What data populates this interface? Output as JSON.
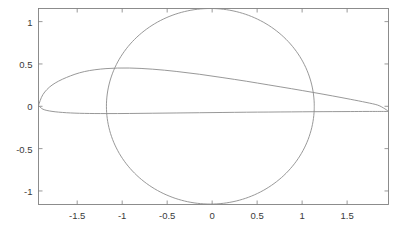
{
  "figure": {
    "background_color": "#ffffff",
    "axes_color": "#808080",
    "curve_color": "#8c8c8c",
    "tick_label_color": "#3a3a3a"
  },
  "chart_data": {
    "type": "line",
    "title": "",
    "xlabel": "",
    "ylabel": "",
    "xlim": [
      -1.93,
      1.96
    ],
    "ylim": [
      -1.16,
      1.155
    ],
    "grid": false,
    "legend": null,
    "legend_position": "none",
    "xticks": [
      -1.5,
      -1,
      -0.5,
      0,
      0.5,
      1,
      1.5
    ],
    "xticklabels": [
      "-1.5",
      "-1",
      "-0.5",
      "0",
      "0.5",
      "1",
      "1.5"
    ],
    "yticks": [
      -1,
      -0.5,
      0,
      0.5,
      1
    ],
    "yticklabels": [
      "-1",
      "-0.5",
      "0",
      "0.5",
      "1"
    ],
    "series": [
      {
        "name": "circle",
        "type": "closed-curve",
        "shape": "circle",
        "center": [
          -0.02,
          0.0
        ],
        "radius": 1.155,
        "color": "#8c8c8c"
      },
      {
        "name": "airfoil",
        "type": "closed-curve",
        "shape": "joukowski-airfoil",
        "color": "#8c8c8c",
        "upper_x": [
          -1.93,
          -1.88,
          -1.78,
          -1.62,
          -1.42,
          -1.18,
          -0.92,
          -0.66,
          -0.4,
          -0.14,
          0.12,
          0.38,
          0.63,
          0.88,
          1.12,
          1.34,
          1.54,
          1.71,
          1.84,
          1.92,
          1.96
        ],
        "upper_y": [
          0.01,
          0.14,
          0.25,
          0.34,
          0.41,
          0.445,
          0.452,
          0.438,
          0.412,
          0.378,
          0.338,
          0.296,
          0.252,
          0.208,
          0.164,
          0.122,
          0.082,
          0.046,
          0.014,
          -0.03,
          -0.062
        ],
        "lower_x": [
          -1.93,
          -1.88,
          -1.78,
          -1.62,
          -1.42,
          -1.18,
          -0.92,
          -0.66,
          -0.4,
          -0.14,
          0.12,
          0.38,
          0.63,
          0.88,
          1.12,
          1.34,
          1.54,
          1.71,
          1.84,
          1.92,
          1.96
        ],
        "lower_y": [
          0.01,
          -0.035,
          -0.06,
          -0.076,
          -0.084,
          -0.086,
          -0.085,
          -0.082,
          -0.079,
          -0.076,
          -0.073,
          -0.07,
          -0.068,
          -0.066,
          -0.064,
          -0.063,
          -0.062,
          -0.061,
          -0.061,
          -0.061,
          -0.062
        ]
      }
    ]
  }
}
